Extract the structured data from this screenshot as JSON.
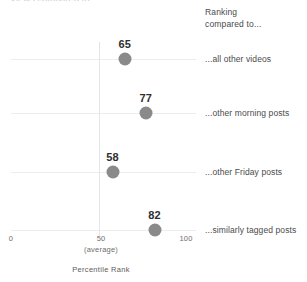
{
  "top_clipped_title": "Views compared to ...",
  "legend": {
    "heading_line1": "Ranking",
    "heading_line2": "compared to..."
  },
  "axis": {
    "title": "Percentile Rank",
    "tick_0": "0",
    "tick_50": "50",
    "tick_100": "100",
    "average_note": "(average)"
  },
  "colors": {
    "dot": "#8a8a8a",
    "gridline": "#ededf1",
    "average_line": "#e4e4e9",
    "value_text": "#2e2e2e",
    "label_text": "#4a4a4a"
  },
  "chart_data": {
    "type": "scatter",
    "title": "",
    "xlabel": "Percentile Rank",
    "ylabel": "",
    "xlim": [
      0,
      100
    ],
    "xticks": [
      0,
      50,
      100
    ],
    "xticklabels": [
      "0",
      "50",
      "100"
    ],
    "grid": true,
    "legend_position": "right",
    "reference_line": {
      "x": 50,
      "label": "(average)"
    },
    "categories": [
      "...all other videos",
      "...other morning posts",
      "...other Friday posts",
      "...similarly tagged posts"
    ],
    "values": [
      65,
      77,
      58,
      82
    ],
    "points": [
      {
        "label": "...all other videos",
        "value": 65,
        "value_text": "65"
      },
      {
        "label": "...other morning posts",
        "value": 77,
        "value_text": "77"
      },
      {
        "label": "...other Friday posts",
        "value": 58,
        "value_text": "58"
      },
      {
        "label": "...similarly tagged posts",
        "value": 82,
        "value_text": "82"
      }
    ]
  }
}
